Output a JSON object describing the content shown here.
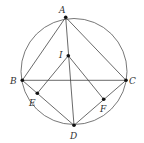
{
  "diagram": {
    "type": "geometry",
    "circle": {
      "cx": 74,
      "cy": 71.5,
      "r": 53
    },
    "points": [
      {
        "id": "A",
        "label": "A",
        "x": 65.7,
        "y": 17.3,
        "lx": 59,
        "ly": 13
      },
      {
        "id": "I",
        "label": "I",
        "x": 68.3,
        "y": 55.7,
        "lx": 59,
        "ly": 58
      },
      {
        "id": "B",
        "label": "B",
        "x": 22.3,
        "y": 80.3,
        "lx": 10,
        "ly": 84
      },
      {
        "id": "C",
        "label": "C",
        "x": 126,
        "y": 80.3,
        "lx": 129,
        "ly": 84
      },
      {
        "id": "E",
        "label": "E",
        "x": 37.3,
        "y": 93.3,
        "lx": 29,
        "ly": 106
      },
      {
        "id": "F",
        "label": "F",
        "x": 103.7,
        "y": 99.3,
        "lx": 100,
        "ly": 112
      },
      {
        "id": "D",
        "label": "D",
        "x": 74,
        "y": 125.3,
        "lx": 70,
        "ly": 139
      }
    ],
    "segments": [
      [
        "A",
        "B"
      ],
      [
        "A",
        "C"
      ],
      [
        "A",
        "D"
      ],
      [
        "B",
        "C"
      ],
      [
        "B",
        "D"
      ],
      [
        "C",
        "D"
      ],
      [
        "I",
        "E"
      ],
      [
        "I",
        "F"
      ]
    ],
    "colors": {
      "stroke": "#444444",
      "point": "#111111",
      "label": "#333333"
    }
  }
}
